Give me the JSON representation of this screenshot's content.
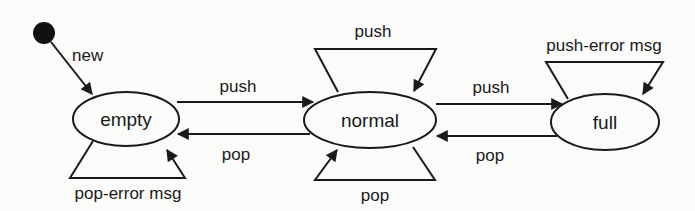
{
  "diagram": {
    "type": "state-machine",
    "title": "",
    "colors": {
      "stroke": "#1a1a1a",
      "background": "#fbfbf9",
      "initial_fill": "#111111"
    },
    "nodes": [
      {
        "id": "initial",
        "kind": "initial-state",
        "label": ""
      },
      {
        "id": "empty",
        "kind": "state",
        "label": "empty"
      },
      {
        "id": "normal",
        "kind": "state",
        "label": "normal"
      },
      {
        "id": "full",
        "kind": "state",
        "label": "full"
      }
    ],
    "edges": [
      {
        "from": "initial",
        "to": "empty",
        "label": "new"
      },
      {
        "from": "empty",
        "to": "normal",
        "label": "push"
      },
      {
        "from": "normal",
        "to": "empty",
        "label": "pop"
      },
      {
        "from": "empty",
        "to": "empty",
        "label": "pop-error msg"
      },
      {
        "from": "normal",
        "to": "normal",
        "label": "push"
      },
      {
        "from": "normal",
        "to": "normal",
        "label": "pop"
      },
      {
        "from": "normal",
        "to": "full",
        "label": "push"
      },
      {
        "from": "full",
        "to": "normal",
        "label": "pop"
      },
      {
        "from": "full",
        "to": "full",
        "label": "push-error msg"
      }
    ]
  }
}
